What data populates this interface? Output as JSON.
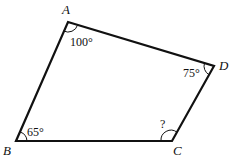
{
  "figure": {
    "type": "quadrilateral",
    "vertices": [
      {
        "name": "A",
        "x": 68,
        "y": 22
      },
      {
        "name": "D",
        "x": 214,
        "y": 66
      },
      {
        "name": "C",
        "x": 172,
        "y": 141
      },
      {
        "name": "B",
        "x": 16,
        "y": 141
      }
    ],
    "labels": {
      "A": "A",
      "B": "B",
      "C": "C",
      "D": "D"
    },
    "angles": {
      "A": "100°",
      "B": "65°",
      "C": "?",
      "D": "75°"
    },
    "stroke_color": "#111111"
  }
}
